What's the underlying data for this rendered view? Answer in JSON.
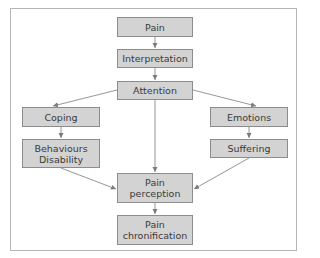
{
  "diagram": {
    "type": "flowchart",
    "nodes": [
      {
        "id": "pain",
        "label": "Pain"
      },
      {
        "id": "interpretation",
        "label": "Interpretation"
      },
      {
        "id": "attention",
        "label": "Attention"
      },
      {
        "id": "coping",
        "label": "Coping"
      },
      {
        "id": "behaviours",
        "label": "Behaviours\nDisability"
      },
      {
        "id": "emotions",
        "label": "Emotions"
      },
      {
        "id": "suffering",
        "label": "Suffering"
      },
      {
        "id": "perception",
        "label": "Pain\nperception"
      },
      {
        "id": "chronification",
        "label": "Pain\nchronification"
      }
    ],
    "edges": [
      [
        "pain",
        "interpretation"
      ],
      [
        "interpretation",
        "attention"
      ],
      [
        "attention",
        "coping"
      ],
      [
        "attention",
        "emotions"
      ],
      [
        "attention",
        "perception"
      ],
      [
        "coping",
        "behaviours"
      ],
      [
        "emotions",
        "suffering"
      ],
      [
        "behaviours",
        "perception"
      ],
      [
        "suffering",
        "perception"
      ],
      [
        "perception",
        "chronification"
      ]
    ],
    "colors": {
      "box_fill": "#d3d3d3",
      "box_border": "#8c8c8c",
      "edge": "#7a7a7a",
      "frame": "#b5b5b5"
    }
  }
}
